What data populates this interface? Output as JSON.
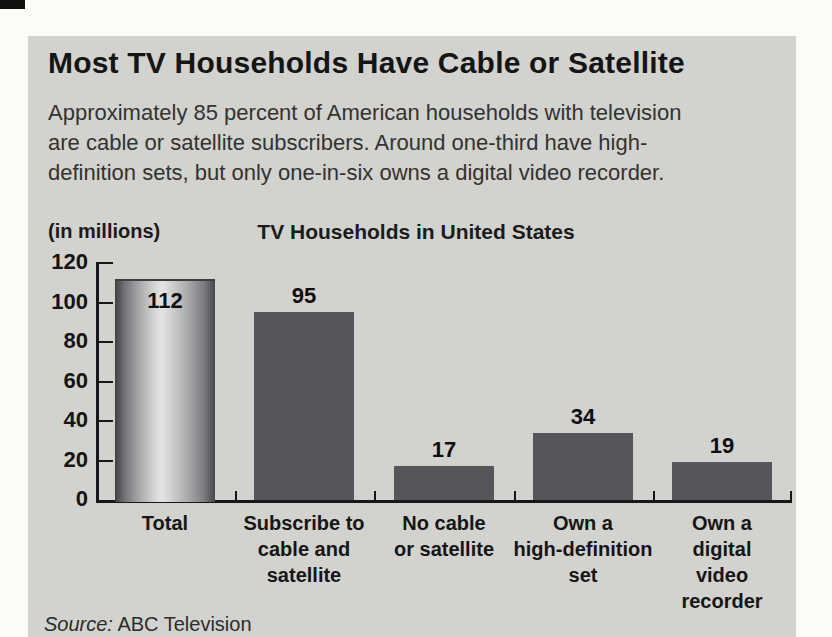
{
  "panel": {
    "title": "Most TV Households Have Cable or Satellite",
    "subtitle": "Approximately 85 percent of American households with television\nare cable or satellite subscribers. Around one-third have high-\ndefinition sets, but only one-in-six owns a digital video recorder.",
    "source_label": "Source:",
    "source_value": "ABC Television"
  },
  "chart_data": {
    "type": "bar",
    "title": "TV Households in United States",
    "ylabel": "(in millions)",
    "xlabel": "",
    "categories": [
      "Total",
      "Subscribe to\ncable and\nsatellite",
      "No cable\nor satellite",
      "Own a\nhigh-definition\nset",
      "Own a\ndigital\nvideo\nrecorder"
    ],
    "values": [
      112,
      95,
      17,
      34,
      19
    ],
    "ylim": [
      0,
      120
    ],
    "yticks": [
      0,
      20,
      40,
      60,
      80,
      100,
      120
    ],
    "grid": false,
    "legend": "none",
    "value_labels_shown": true,
    "source": "Source: ABC Television"
  },
  "colors": {
    "panel_bg": "#d2d2cf",
    "bar_fill": "#55565a",
    "total_bar_highlight": "#e4e4e3",
    "axis": "#17171a",
    "text": "#1b1b1b"
  }
}
